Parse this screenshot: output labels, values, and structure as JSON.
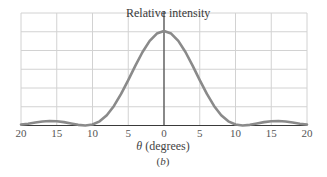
{
  "chart_data": {
    "type": "line",
    "title": "",
    "ylabel": "Relative intensity",
    "xlabel": "θ (degrees)",
    "xlabel_symbol": "θ",
    "xlabel_text": "(degrees)",
    "panel_label": "b",
    "xlim": [
      -20,
      20
    ],
    "ylim": [
      0,
      1.2
    ],
    "grid": true,
    "x_ticks": [
      -20,
      -15,
      -10,
      -5,
      0,
      5,
      10,
      15,
      20
    ],
    "x_tick_labels": [
      "20",
      "15",
      "10",
      "5",
      "0",
      "5",
      "10",
      "15",
      "20"
    ],
    "y_grid_lines": 6,
    "series": [
      {
        "name": "Relative intensity",
        "color": "#8a8a8a",
        "x": [
          -20,
          -19,
          -18,
          -17,
          -16,
          -15,
          -14,
          -13,
          -12,
          -11,
          -10,
          -9,
          -8,
          -7,
          -6,
          -5,
          -4,
          -3,
          -2,
          -1,
          0,
          1,
          2,
          3,
          4,
          5,
          6,
          7,
          8,
          9,
          10,
          11,
          12,
          13,
          14,
          15,
          16,
          17,
          18,
          19,
          20
        ],
        "values": [
          0.009,
          0.019,
          0.031,
          0.042,
          0.047,
          0.045,
          0.036,
          0.021,
          0.007,
          0.0,
          0.01,
          0.044,
          0.109,
          0.207,
          0.334,
          0.48,
          0.634,
          0.778,
          0.896,
          0.973,
          1.0,
          0.973,
          0.896,
          0.778,
          0.634,
          0.48,
          0.334,
          0.207,
          0.109,
          0.044,
          0.01,
          0.0,
          0.007,
          0.021,
          0.036,
          0.045,
          0.047,
          0.042,
          0.031,
          0.019,
          0.009
        ]
      }
    ]
  },
  "colors": {
    "curve": "#8a8a8a",
    "grid": "#d2d2d2",
    "axis": "#3a3a3a"
  }
}
